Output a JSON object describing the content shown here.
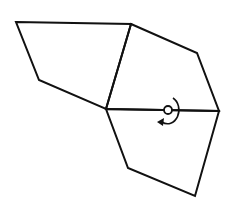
{
  "diagram": {
    "stroke_color": "#111111",
    "background": "#ffffff",
    "vertices": {
      "A": [
        16,
        22
      ],
      "B": [
        131,
        24
      ],
      "C": [
        197,
        53
      ],
      "D": [
        219,
        111
      ],
      "E": [
        106,
        109
      ],
      "F": [
        39,
        80
      ],
      "G": [
        128,
        168
      ],
      "H": [
        195,
        196
      ]
    },
    "faces": [
      {
        "name": "upper-left-face",
        "points": "16,22 131,24 106,109 39,80"
      },
      {
        "name": "upper-right-face",
        "points": "131,24 197,53 219,111 106,109"
      },
      {
        "name": "lower-face",
        "points": "106,109 219,111 195,196 128,168"
      }
    ],
    "rotation_marker": {
      "center": [
        168,
        110
      ],
      "radius": 4,
      "direction": "clockwise"
    }
  }
}
